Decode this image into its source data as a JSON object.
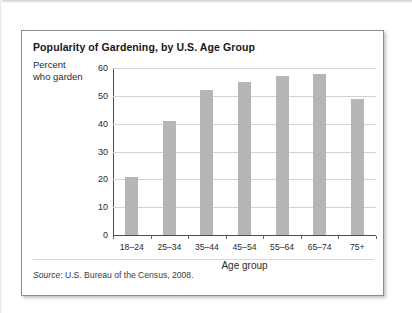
{
  "figure": {
    "title": "Popularity of Gardening, by U.S. Age Group",
    "y_caption_line1": "Percent",
    "y_caption_line2": "who garden",
    "source_label": "Source",
    "source_separator": ": ",
    "source_text": "U.S. Bureau of the Census, 2008."
  },
  "chart_data": {
    "type": "bar",
    "title": "Popularity of Gardening, by U.S. Age Group",
    "xlabel": "Age group",
    "ylabel": "Percent who garden",
    "categories": [
      "18–24",
      "25–34",
      "35–44",
      "45–54",
      "55–64",
      "65–74",
      "75+"
    ],
    "values": [
      21,
      41,
      52,
      55,
      57,
      58,
      49
    ],
    "ylim": [
      0,
      60
    ],
    "yticks": [
      0,
      10,
      20,
      30,
      40,
      50,
      60
    ],
    "ytick_labels": [
      "0",
      "10",
      "20",
      "30",
      "40",
      "50",
      "60"
    ],
    "grid": true,
    "legend": false,
    "bar_color": "#b6b6b6",
    "axis_color": "#4d4d4d",
    "gridline_color": "#d2d2d2"
  }
}
